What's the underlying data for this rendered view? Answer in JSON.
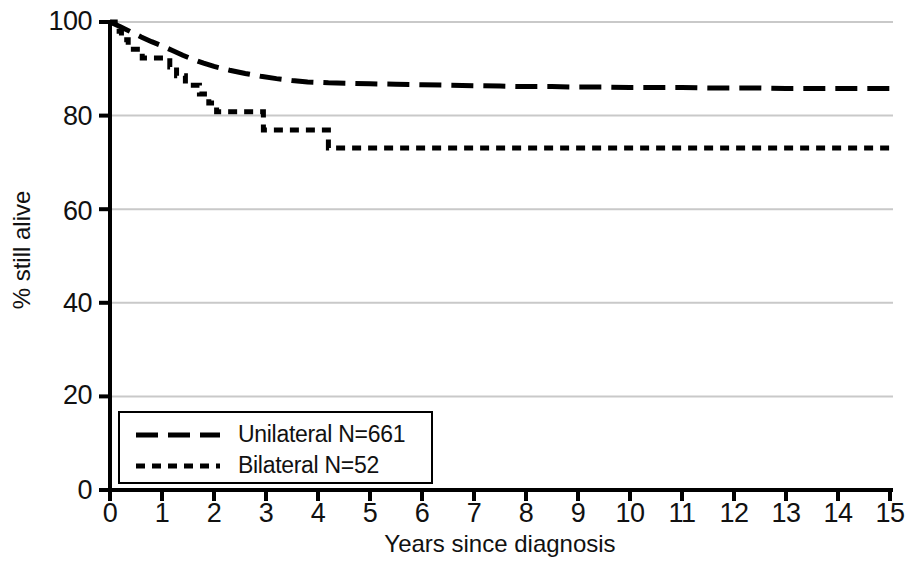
{
  "chart_data": {
    "type": "line",
    "subtype": "kaplan-meier-survival",
    "title": "",
    "xlabel": "Years since diagnosis",
    "ylabel": "% still alive",
    "xlim": [
      0,
      15
    ],
    "ylim": [
      0,
      100
    ],
    "xticks": [
      "0",
      "1",
      "2",
      "3",
      "4",
      "5",
      "6",
      "7",
      "8",
      "9",
      "10",
      "11",
      "12",
      "13",
      "14",
      "15"
    ],
    "yticks": [
      "0",
      "20",
      "40",
      "60",
      "80",
      "100"
    ],
    "xtick_values": [
      0,
      1,
      2,
      3,
      4,
      5,
      6,
      7,
      8,
      9,
      10,
      11,
      12,
      13,
      14,
      15
    ],
    "ytick_values": [
      0,
      20,
      40,
      60,
      80,
      100
    ],
    "grid": "horizontal",
    "grid_color": "#c9c9c9",
    "legend_position": "lower-left-inside",
    "line_color": "#000000",
    "series": [
      {
        "name": "Unilateral N=661",
        "label": "Unilateral N=661",
        "n": 661,
        "dash": "long",
        "dasharray": "22 10",
        "width": 5,
        "x": [
          0.0,
          0.2,
          0.4,
          0.6,
          0.8,
          1.0,
          1.2,
          1.4,
          1.6,
          1.8,
          2.0,
          2.3,
          2.6,
          2.9,
          3.2,
          3.5,
          3.8,
          4.2,
          4.6,
          5.0,
          5.5,
          6.0,
          6.5,
          7.0,
          7.5,
          8.0,
          8.5,
          9.0,
          9.5,
          10.0,
          10.5,
          11.0,
          11.5,
          12.0,
          12.5,
          13.0,
          13.5,
          14.0,
          14.5,
          15.0
        ],
        "y": [
          100.0,
          99.0,
          97.9,
          96.8,
          95.8,
          94.9,
          93.9,
          92.9,
          92.0,
          91.2,
          90.5,
          89.7,
          89.0,
          88.4,
          87.9,
          87.5,
          87.2,
          87.0,
          86.9,
          86.8,
          86.7,
          86.6,
          86.5,
          86.4,
          86.3,
          86.2,
          86.2,
          86.1,
          86.1,
          86.0,
          86.0,
          86.0,
          85.9,
          85.9,
          85.9,
          85.8,
          85.8,
          85.8,
          85.8,
          85.8
        ],
        "end_value": 85.8
      },
      {
        "name": "Bilateral N=52",
        "label": "Bilateral N=52",
        "n": 52,
        "dash": "short",
        "dasharray": "9 7",
        "width": 5,
        "step": true,
        "x": [
          0.0,
          0.1,
          0.22,
          0.35,
          0.5,
          0.62,
          0.95,
          1.15,
          1.28,
          1.45,
          1.58,
          1.72,
          1.9,
          2.05,
          2.2,
          2.4,
          2.8,
          2.95,
          4.2,
          15.0
        ],
        "y": [
          100.0,
          98.0,
          96.2,
          94.2,
          94.2,
          92.3,
          92.3,
          90.4,
          88.5,
          86.5,
          86.5,
          84.6,
          82.7,
          80.8,
          80.8,
          80.8,
          80.8,
          76.9,
          73.1,
          73.1
        ],
        "end_value": 73.1
      }
    ]
  },
  "axes": {
    "y_axis_title": "% still alive",
    "x_axis_title": "Years since diagnosis"
  },
  "legend": {
    "items": [
      {
        "label": "Unilateral N=661"
      },
      {
        "label": "Bilateral N=52"
      }
    ]
  }
}
